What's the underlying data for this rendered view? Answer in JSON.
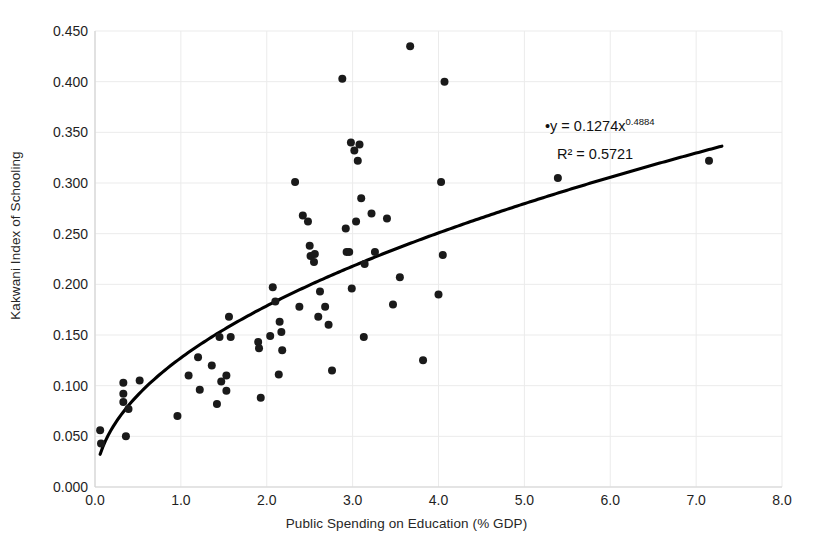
{
  "chart_data": {
    "type": "scatter",
    "title": "",
    "xlabel": "Public Spending on Education (% GDP)",
    "ylabel": "Kakwani Index of Schooling",
    "xlim": [
      0.0,
      8.0
    ],
    "ylim": [
      0.0,
      0.45
    ],
    "xticks": [
      "0.0",
      "1.0",
      "2.0",
      "3.0",
      "4.0",
      "5.0",
      "6.0",
      "7.0",
      "8.0"
    ],
    "xtick_values": [
      0.0,
      1.0,
      2.0,
      3.0,
      4.0,
      5.0,
      6.0,
      7.0,
      8.0
    ],
    "yticks": [
      "0.000",
      "0.050",
      "0.100",
      "0.150",
      "0.200",
      "0.250",
      "0.300",
      "0.350",
      "0.400",
      "0.450"
    ],
    "ytick_values": [
      0.0,
      0.05,
      0.1,
      0.15,
      0.2,
      0.25,
      0.3,
      0.35,
      0.4,
      0.45
    ],
    "grid": true,
    "legend": "none",
    "marker_color": "#1a1a1a",
    "marker_size": 4,
    "trendline": {
      "type": "power",
      "coefficient": 0.1274,
      "exponent": 0.4884,
      "r_squared": 0.5721,
      "equation_text": "y = 0.1274x",
      "equation_exponent": "0.4884",
      "r2_text": "R² = 0.5721",
      "color": "#000000",
      "x_start": 0.06,
      "x_end": 7.3
    },
    "points": [
      {
        "x": 0.06,
        "y": 0.056
      },
      {
        "x": 0.07,
        "y": 0.043
      },
      {
        "x": 0.33,
        "y": 0.103
      },
      {
        "x": 0.33,
        "y": 0.092
      },
      {
        "x": 0.33,
        "y": 0.084
      },
      {
        "x": 0.36,
        "y": 0.05
      },
      {
        "x": 0.39,
        "y": 0.077
      },
      {
        "x": 0.52,
        "y": 0.105
      },
      {
        "x": 0.96,
        "y": 0.07
      },
      {
        "x": 1.09,
        "y": 0.11
      },
      {
        "x": 1.2,
        "y": 0.128
      },
      {
        "x": 1.22,
        "y": 0.096
      },
      {
        "x": 1.36,
        "y": 0.12
      },
      {
        "x": 1.42,
        "y": 0.082
      },
      {
        "x": 1.45,
        "y": 0.148
      },
      {
        "x": 1.47,
        "y": 0.104
      },
      {
        "x": 1.53,
        "y": 0.11
      },
      {
        "x": 1.53,
        "y": 0.095
      },
      {
        "x": 1.56,
        "y": 0.168
      },
      {
        "x": 1.58,
        "y": 0.148
      },
      {
        "x": 1.9,
        "y": 0.143
      },
      {
        "x": 1.91,
        "y": 0.137
      },
      {
        "x": 1.93,
        "y": 0.088
      },
      {
        "x": 2.04,
        "y": 0.149
      },
      {
        "x": 2.07,
        "y": 0.197
      },
      {
        "x": 2.1,
        "y": 0.183
      },
      {
        "x": 2.14,
        "y": 0.111
      },
      {
        "x": 2.15,
        "y": 0.163
      },
      {
        "x": 2.17,
        "y": 0.153
      },
      {
        "x": 2.18,
        "y": 0.135
      },
      {
        "x": 2.33,
        "y": 0.301
      },
      {
        "x": 2.38,
        "y": 0.178
      },
      {
        "x": 2.42,
        "y": 0.268
      },
      {
        "x": 2.48,
        "y": 0.262
      },
      {
        "x": 2.5,
        "y": 0.238
      },
      {
        "x": 2.51,
        "y": 0.228
      },
      {
        "x": 2.55,
        "y": 0.222
      },
      {
        "x": 2.56,
        "y": 0.23
      },
      {
        "x": 2.6,
        "y": 0.168
      },
      {
        "x": 2.62,
        "y": 0.193
      },
      {
        "x": 2.68,
        "y": 0.178
      },
      {
        "x": 2.72,
        "y": 0.16
      },
      {
        "x": 2.76,
        "y": 0.115
      },
      {
        "x": 2.88,
        "y": 0.403
      },
      {
        "x": 2.92,
        "y": 0.255
      },
      {
        "x": 2.93,
        "y": 0.232
      },
      {
        "x": 2.96,
        "y": 0.232
      },
      {
        "x": 2.98,
        "y": 0.34
      },
      {
        "x": 2.99,
        "y": 0.196
      },
      {
        "x": 3.02,
        "y": 0.332
      },
      {
        "x": 3.04,
        "y": 0.262
      },
      {
        "x": 3.06,
        "y": 0.322
      },
      {
        "x": 3.08,
        "y": 0.338
      },
      {
        "x": 3.1,
        "y": 0.285
      },
      {
        "x": 3.13,
        "y": 0.148
      },
      {
        "x": 3.14,
        "y": 0.22
      },
      {
        "x": 3.22,
        "y": 0.27
      },
      {
        "x": 3.26,
        "y": 0.232
      },
      {
        "x": 3.4,
        "y": 0.265
      },
      {
        "x": 3.47,
        "y": 0.18
      },
      {
        "x": 3.55,
        "y": 0.207
      },
      {
        "x": 3.67,
        "y": 0.435
      },
      {
        "x": 3.82,
        "y": 0.125
      },
      {
        "x": 4.0,
        "y": 0.19
      },
      {
        "x": 4.03,
        "y": 0.301
      },
      {
        "x": 4.05,
        "y": 0.229
      },
      {
        "x": 4.07,
        "y": 0.4
      },
      {
        "x": 5.39,
        "y": 0.305
      },
      {
        "x": 7.15,
        "y": 0.322
      }
    ]
  }
}
